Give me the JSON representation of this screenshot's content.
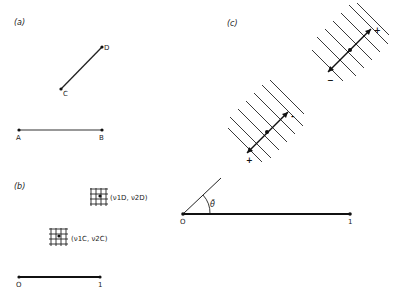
{
  "panels": {
    "a": {
      "label": "(a)",
      "points": {
        "A": "A",
        "B": "B",
        "C": "C",
        "D": "D"
      }
    },
    "b": {
      "label": "(b)",
      "grid_upper_label": "(ν1D, ν2D)",
      "grid_lower_label": "(ν1C, ν2C)",
      "axis_start": "O",
      "axis_end": "1"
    },
    "c": {
      "label": "(c)",
      "upper_plus": "+",
      "upper_minus": "−",
      "lower_minus": "-",
      "lower_plus": "+",
      "angle_label": "θ̄",
      "axis_start": "O",
      "axis_end": "1"
    }
  },
  "colors": {
    "ink": "#222222",
    "background": "#ffffff"
  }
}
